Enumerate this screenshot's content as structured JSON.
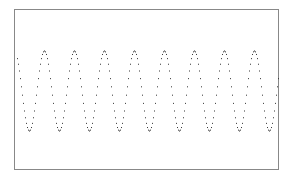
{
  "chart_data": {
    "type": "scatter",
    "style": "dotted-line",
    "title": "",
    "xlabel": "",
    "ylabel": "",
    "legend": [],
    "grid": false,
    "axes_ticks": false,
    "function": "cos",
    "cycles": 8.8,
    "amplitude": 1,
    "xlim": [
      0,
      8.8
    ],
    "ylim": [
      -2,
      2
    ],
    "x_start": 0.1,
    "num_points": 262,
    "peaks_x": [
      0,
      1,
      2,
      3,
      4,
      5,
      6,
      7,
      8
    ],
    "troughs_x": [
      0.5,
      1.5,
      2.5,
      3.5,
      4.5,
      5.5,
      6.5,
      7.5,
      8.5
    ],
    "x": [
      0.1,
      0.5,
      1.0,
      1.5,
      2.0,
      2.5,
      3.0,
      3.5,
      4.0,
      4.5,
      5.0,
      5.5,
      6.0,
      6.5,
      7.0,
      7.5,
      8.0,
      8.5,
      8.8
    ],
    "values": [
      0.81,
      -1,
      1,
      -1,
      1,
      -1,
      1,
      -1,
      1,
      -1,
      1,
      -1,
      1,
      -1,
      1,
      -1,
      1,
      -1,
      0.31
    ]
  },
  "colors": {
    "background": "#ffffff",
    "frame": "#888888",
    "points": "#333333"
  },
  "layout": {
    "frame": {
      "x": 14.5,
      "y": 9.5,
      "w": 264,
      "h": 160
    },
    "center_y": 91,
    "amp_px": 40,
    "period_px": 30
  }
}
